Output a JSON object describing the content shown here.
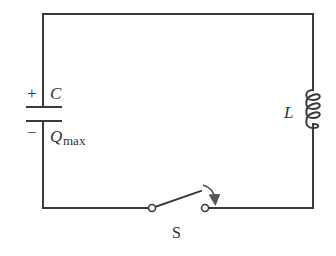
{
  "diagram": {
    "type": "LC circuit",
    "capacitor": {
      "label": "C",
      "plus_sign": "+",
      "minus_sign": "−",
      "charge_symbol": "Q",
      "charge_subscript": "max"
    },
    "inductor": {
      "label": "L",
      "loops": 4
    },
    "switch": {
      "label": "S",
      "state": "open",
      "arrow": "closing-direction-arrow"
    },
    "colors": {
      "wire": "#3a3a3a",
      "text": "#333333",
      "background": "#ffffff"
    }
  }
}
